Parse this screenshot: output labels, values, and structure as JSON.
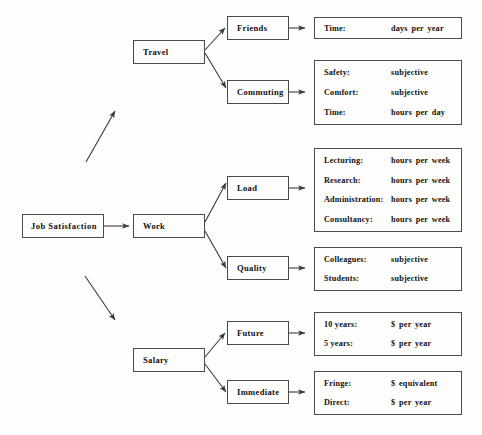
{
  "diagram": {
    "root": {
      "label": "Job Satisfaction"
    },
    "branches": [
      {
        "label": "Travel",
        "children": [
          {
            "label": "Friends",
            "attributes": [
              {
                "key": "Time:",
                "value": "days per year"
              }
            ]
          },
          {
            "label": "Commuting",
            "attributes": [
              {
                "key": "Safety:",
                "value": "subjective"
              },
              {
                "key": "Comfort:",
                "value": "subjective"
              },
              {
                "key": "Time:",
                "value": "hours per day"
              }
            ]
          }
        ]
      },
      {
        "label": "Work",
        "children": [
          {
            "label": "Load",
            "attributes": [
              {
                "key": "Lecturing:",
                "value": "hours per week"
              },
              {
                "key": "Research:",
                "value": "hours per week"
              },
              {
                "key": "Administration:",
                "value": "hours per week"
              },
              {
                "key": "Consultancy:",
                "value": "hours per week"
              }
            ]
          },
          {
            "label": "Quality",
            "attributes": [
              {
                "key": "Colleagues:",
                "value": "subjective"
              },
              {
                "key": "Students:",
                "value": "subjective"
              }
            ]
          }
        ]
      },
      {
        "label": "Salary",
        "children": [
          {
            "label": "Future",
            "attributes": [
              {
                "key": "10 years:",
                "value": "$ per year"
              },
              {
                "key": "5 years:",
                "value": "$ per year"
              }
            ]
          },
          {
            "label": "Immediate",
            "attributes": [
              {
                "key": "Fringe:",
                "value": "$ equivalent"
              },
              {
                "key": "Direct:",
                "value": "$ per year"
              }
            ]
          }
        ]
      }
    ],
    "colors": {
      "border": "#4a4a4a",
      "text": "#111111",
      "arrow": "#3a3a3a",
      "background": "#fdfdfc"
    }
  }
}
